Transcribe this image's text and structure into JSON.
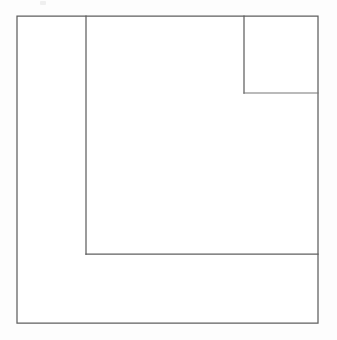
{
  "figure": {
    "title": "Nested rectangles line drawing",
    "canvas": {
      "width": 337,
      "height": 340,
      "background_color": "#fdfdfd"
    },
    "style": {
      "stroke_color": "#5f5f5f",
      "stroke_color_soft": "#767676",
      "stroke_width": 1.25,
      "fill_color": "#ffffff"
    },
    "geometry": {
      "outer_rect": {
        "label": "outer-rectangle",
        "x": 17,
        "y": 16,
        "width": 301,
        "height": 307,
        "x2": 318,
        "y2": 323
      },
      "left_divider": {
        "label": "left-vertical-divider",
        "x1": 86,
        "y1": 16,
        "x2": 86,
        "y2": 254
      },
      "bottom_divider": {
        "label": "bottom-horizontal-divider",
        "x1": 86,
        "y1": 254,
        "x2": 318,
        "y2": 254
      },
      "corner_square_left_edge": {
        "label": "corner-square-left-edge",
        "x1": 244,
        "y1": 16,
        "x2": 244,
        "y2": 93
      },
      "corner_square_bottom_edge": {
        "label": "corner-square-bottom-edge",
        "x1": 244,
        "y1": 93,
        "x2": 318,
        "y2": 93
      }
    },
    "regions": [
      {
        "name": "left-strip",
        "x": 17,
        "y": 16,
        "width": 69,
        "height": 307
      },
      {
        "name": "corner-square",
        "x": 244,
        "y": 16,
        "width": 74,
        "height": 77
      },
      {
        "name": "central-region",
        "x": 86,
        "y": 16,
        "width": 232,
        "height": 238
      },
      {
        "name": "bottom-band",
        "x": 86,
        "y": 254,
        "width": 232,
        "height": 69
      }
    ],
    "artifact": {
      "name": "scan-speck",
      "x": 40,
      "y": 1,
      "width": 6,
      "height": 4,
      "color": "#e9e9e9"
    }
  }
}
